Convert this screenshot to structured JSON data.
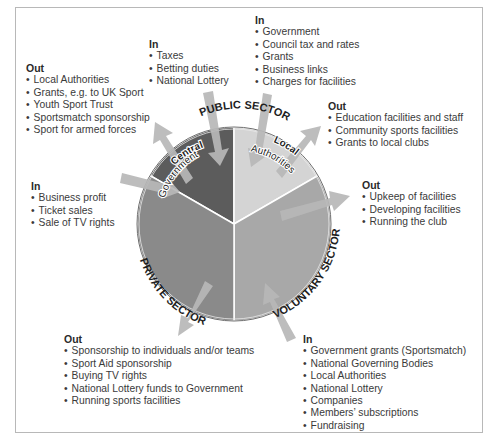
{
  "sectors": {
    "public": {
      "label": "PUBLIC SECTOR",
      "central_government": {
        "label_line1": "Central",
        "label_line2": "Government",
        "in": {
          "heading": "In",
          "items": [
            "Taxes",
            "Betting duties",
            "National Lottery"
          ]
        },
        "out": {
          "heading": "Out",
          "items": [
            "Local Authorities",
            "Grants, e.g. to UK Sport",
            "Youth Sport Trust",
            "Sportsmatch sponsorship",
            "Sport for armed forces"
          ]
        }
      },
      "local_authorities": {
        "label_line1": "Local",
        "label_line2": "Authorities",
        "in": {
          "heading": "In",
          "items": [
            "Government",
            "Council tax and rates",
            "Grants",
            "Business links",
            "Charges for facilities"
          ]
        },
        "out": {
          "heading": "Out",
          "items": [
            "Education facilities and staff",
            "Community sports facilities",
            "Grants to local clubs"
          ]
        }
      }
    },
    "private": {
      "label": "PRIVATE SECTOR",
      "in": {
        "heading": "In",
        "items": [
          "Business profit",
          "Ticket sales",
          "Sale of TV rights"
        ]
      },
      "out": {
        "heading": "Out",
        "items": [
          "Sponsorship to individuals and/or teams",
          "Sport Aid sponsorship",
          "Buying TV rights",
          "National Lottery funds to Government",
          "Running sports facilities"
        ]
      }
    },
    "voluntary": {
      "label": "VOLUNTARY SECTOR",
      "in": {
        "heading": "In",
        "items": [
          "Government grants (Sportsmatch)",
          "National Governing Bodies",
          "Local Authorities",
          "National Lottery",
          "Companies",
          "Members’ subscriptions",
          "Fundraising"
        ]
      },
      "out": {
        "heading": "Out",
        "items": [
          "Upkeep of facilities",
          "Developing facilities",
          "Running the club"
        ]
      }
    }
  },
  "colors": {
    "central_government": "#5c5c5c",
    "local_authorities": "#d4d4d4",
    "private": "#8a8a8a",
    "voluntary": "#a8a8a8",
    "arrow": "#b4b4b4",
    "frame": "#b8b8b8"
  }
}
